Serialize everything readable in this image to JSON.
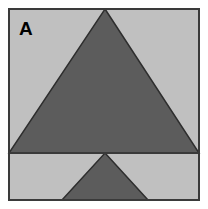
{
  "figure": {
    "panel_label": "A",
    "alt_description": "Panel A: a large dark gray upward-pointing triangle on a light gray square, with a smaller dark gray upward-pointing triangle in a strip below a horizontal divider line",
    "canvas": {
      "width": 208,
      "height": 209,
      "background_color": "#ffffff"
    },
    "frame": {
      "x": 8,
      "y": 8,
      "width": 191,
      "height": 192,
      "fill_color": "#c0c0c0",
      "stroke_color": "#3a3a3a",
      "stroke_width": 2
    },
    "divider": {
      "name": "horizontal-divider-line",
      "y": 153,
      "x_start": 8,
      "x_end": 199,
      "color": "#3a3a3a",
      "width": 2
    },
    "shapes": [
      {
        "name": "large-triangle",
        "type": "triangle",
        "orientation": "up",
        "fill_color": "#5c5c5c",
        "stroke_color": "#2e2e2e",
        "stroke_width": 1.5,
        "points": "105,9 199,153 9,153",
        "apex": {
          "x": 105,
          "y": 9
        },
        "base_left": {
          "x": 9,
          "y": 153
        },
        "base_right": {
          "x": 199,
          "y": 153
        },
        "base_width": 190,
        "height": 144
      },
      {
        "name": "small-triangle",
        "type": "triangle",
        "orientation": "up",
        "fill_color": "#5c5c5c",
        "stroke_color": "#2e2e2e",
        "stroke_width": 1.5,
        "points": "105,153 148,200 62,200",
        "apex": {
          "x": 105,
          "y": 153
        },
        "base_left": {
          "x": 62,
          "y": 200
        },
        "base_right": {
          "x": 148,
          "y": 200
        },
        "base_width": 86,
        "height": 47,
        "clipped_at_frame_bottom": true
      }
    ],
    "label": {
      "text": "A",
      "x": 19,
      "y": 35,
      "font_size": 19,
      "font_weight": "bold",
      "color": "#000000"
    }
  }
}
